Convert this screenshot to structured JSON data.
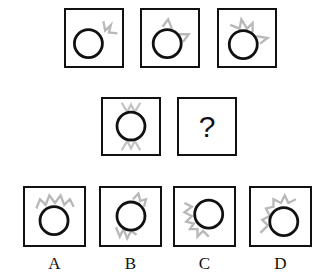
{
  "puzzle": {
    "question_mark": "?",
    "colors": {
      "circle": "#111111",
      "spikes": "#b8b8b8",
      "border": "#111111"
    },
    "rows": [
      {
        "name": "sequence-row-1",
        "cells": [
          {
            "spikes": "top-right-small"
          },
          {
            "spikes": "top-right-medium"
          },
          {
            "spikes": "top-right-large"
          }
        ]
      },
      {
        "name": "sequence-row-2",
        "cells": [
          {
            "spikes": "top-and-bottom"
          },
          {
            "spikes": "unknown"
          }
        ]
      }
    ],
    "options": [
      {
        "label": "A",
        "spikes": "top"
      },
      {
        "label": "B",
        "spikes": "top-right-and-bottom-left"
      },
      {
        "label": "C",
        "spikes": "left-and-bottom"
      },
      {
        "label": "D",
        "spikes": "left-and-top"
      }
    ]
  }
}
